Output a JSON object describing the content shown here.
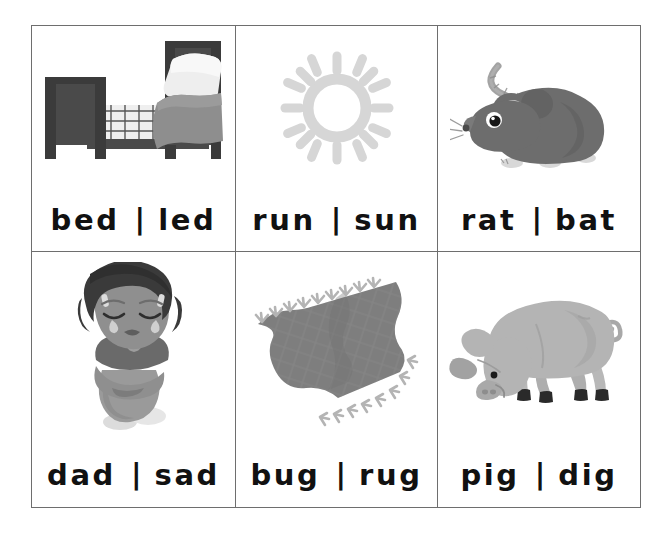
{
  "page": {
    "background_color": "#ffffff",
    "border_color": "#6e6e6e",
    "text_color": "#111111",
    "separator": "|"
  },
  "grid": {
    "columns": 3,
    "rows": 2,
    "cards": [
      {
        "id": "card-bed-led",
        "row": 1,
        "column": 1,
        "picture": "bed-illustration",
        "picture_label": "bed",
        "word_left": "bed",
        "word_right": "led",
        "separator": "|",
        "rime": "-ed",
        "colors": {
          "frame": "#4a4a4a",
          "frame_dark": "#3b3b3b",
          "blanket": "#8e8e8e",
          "pillow": "#eeeeee",
          "sheet": "#d9d9d9"
        }
      },
      {
        "id": "card-run-sun",
        "row": 1,
        "column": 2,
        "picture": "sun-illustration",
        "picture_label": "sun",
        "word_left": "run",
        "word_right": "sun",
        "separator": "|",
        "rime": "-un",
        "colors": {
          "sun": "#d6d6d6"
        }
      },
      {
        "id": "card-rat-bat",
        "row": 1,
        "column": 3,
        "picture": "rat-illustration",
        "picture_label": "rat",
        "word_left": "rat",
        "word_right": "bat",
        "separator": "|",
        "rime": "-at",
        "colors": {
          "body": "#6d6d6d",
          "body_dark": "#5c5c5c",
          "ear_inner": "#cfcfcf",
          "tail": "#a3a3a3",
          "feet": "#d8d8d8",
          "eye": "#1a1a1a"
        }
      },
      {
        "id": "card-dad-sad",
        "row": 2,
        "column": 1,
        "picture": "sad-child-illustration",
        "picture_label": "sad child",
        "word_left": "dad",
        "word_right": "sad",
        "separator": "|",
        "rime": "-ad",
        "colors": {
          "hair": "#3a3a3a",
          "skin": "#8f8f8f",
          "skin_shade": "#7c7c7c",
          "shirt": "#6a6a6a",
          "pants": "#9a9a9a",
          "shoes": "#dcdcdc",
          "tear": "#cfcfcf"
        }
      },
      {
        "id": "card-bug-rug",
        "row": 2,
        "column": 2,
        "picture": "rug-illustration",
        "picture_label": "rug",
        "word_left": "bug",
        "word_right": "rug",
        "separator": "|",
        "rime": "-ug",
        "colors": {
          "rug": "#7e7e7e",
          "rug_dark": "#6f6f6f",
          "fringe": "#b4b4b4"
        }
      },
      {
        "id": "card-pig-dig",
        "row": 2,
        "column": 3,
        "picture": "pig-illustration",
        "picture_label": "pig",
        "word_left": "pig",
        "word_right": "dig",
        "separator": "|",
        "rime": "-ig",
        "colors": {
          "body": "#b4b4b4",
          "body_shade": "#a2a2a2",
          "hoof": "#2a2a2a",
          "eye": "#1a1a1a"
        }
      }
    ]
  }
}
